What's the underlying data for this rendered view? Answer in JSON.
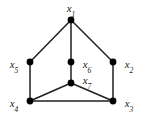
{
  "figure": {
    "type": "undirected-graph-diagram",
    "width": 147,
    "height": 120,
    "background_color": "#ffffff",
    "edge_color": "#231f20",
    "vertex_color": "#000000",
    "label_color": "#1a1a1a",
    "vertex_radius": 3.4,
    "edge_width": 1.5
  },
  "vertices": [
    {
      "id": "x1",
      "name": "x",
      "subscript": "1",
      "cx": 71,
      "cy": 20,
      "label_x": 71,
      "label_y": 8
    },
    {
      "id": "x2",
      "name": "x",
      "subscript": "2",
      "cx": 113,
      "cy": 62,
      "label_x": 129,
      "label_y": 64
    },
    {
      "id": "x3",
      "name": "x",
      "subscript": "3",
      "cx": 113,
      "cy": 101,
      "label_x": 129,
      "label_y": 103
    },
    {
      "id": "x4",
      "name": "x",
      "subscript": "4",
      "cx": 30,
      "cy": 101,
      "label_x": 14,
      "label_y": 103
    },
    {
      "id": "x5",
      "name": "x",
      "subscript": "5",
      "cx": 30,
      "cy": 62,
      "label_x": 14,
      "label_y": 64
    },
    {
      "id": "x6",
      "name": "x",
      "subscript": "6",
      "cx": 71,
      "cy": 62,
      "label_x": 87,
      "label_y": 64
    },
    {
      "id": "x7",
      "name": "x",
      "subscript": "7",
      "cx": 71,
      "cy": 83,
      "label_x": 87,
      "label_y": 80
    }
  ],
  "edges": [
    {
      "from": "x1",
      "to": "x5",
      "x1": 71,
      "y1": 20,
      "x2": 30,
      "y2": 62
    },
    {
      "from": "x1",
      "to": "x6",
      "x1": 71,
      "y1": 20,
      "x2": 71,
      "y2": 62
    },
    {
      "from": "x1",
      "to": "x2",
      "x1": 71,
      "y1": 20,
      "x2": 113,
      "y2": 62
    },
    {
      "from": "x5",
      "to": "x4",
      "x1": 30,
      "y1": 62,
      "x2": 30,
      "y2": 101
    },
    {
      "from": "x2",
      "to": "x3",
      "x1": 113,
      "y1": 62,
      "x2": 113,
      "y2": 101
    },
    {
      "from": "x6",
      "to": "x7",
      "x1": 71,
      "y1": 62,
      "x2": 71,
      "y2": 83
    },
    {
      "from": "x7",
      "to": "x4",
      "x1": 71,
      "y1": 83,
      "x2": 30,
      "y2": 101
    },
    {
      "from": "x7",
      "to": "x3",
      "x1": 71,
      "y1": 83,
      "x2": 113,
      "y2": 101
    },
    {
      "from": "x4",
      "to": "x3",
      "x1": 30,
      "y1": 101,
      "x2": 113,
      "y2": 101
    }
  ]
}
